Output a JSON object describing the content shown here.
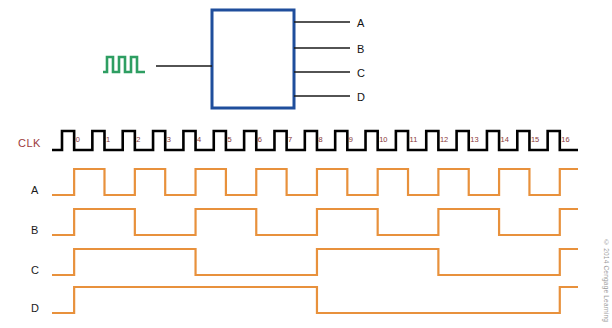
{
  "figure": {
    "type": "timing-diagram",
    "background_color": "#ffffff"
  },
  "block_diagram": {
    "box": {
      "border_color": "#1f4e9c",
      "fill_color": "#ffffff",
      "x": 212,
      "y": 10,
      "width": 82,
      "height": 98
    },
    "clk_input_label": "CLK",
    "clk_input_color": "#a04848",
    "clock_symbol": {
      "name": "clock-pulse-icon",
      "color": "#2e9e62",
      "pulses": 3
    },
    "outputs": [
      {
        "pin": "Q",
        "sub": "A",
        "net": "A"
      },
      {
        "pin": "Q",
        "sub": "B",
        "net": "B"
      },
      {
        "pin": "Q",
        "sub": "C",
        "net": "C"
      },
      {
        "pin": "Q",
        "sub": "D",
        "net": "D"
      }
    ],
    "wire_color": "#1a1a1a"
  },
  "timing": {
    "clk_row_label": "CLK",
    "clk_label_color": "#9c3b3b",
    "clk_trace_color": "#000000",
    "signal_trace_color": "#e8913c",
    "cycle_number_color": "#8a3a3a",
    "cycle_numbers": [
      "0",
      "1",
      "2",
      "3",
      "4",
      "5",
      "6",
      "7",
      "8",
      "9",
      "10",
      "11",
      "12",
      "13",
      "14",
      "15",
      "16"
    ],
    "rows": [
      {
        "label": "CLK",
        "divider": 1
      },
      {
        "label": "A",
        "divider": 2
      },
      {
        "label": "B",
        "divider": 4
      },
      {
        "label": "C",
        "divider": 8
      },
      {
        "label": "D",
        "divider": 16
      }
    ]
  },
  "chart_data": {
    "type": "line",
    "xlabel": "Clock pulse number",
    "ylabel": "Logic level",
    "x": [
      0,
      1,
      2,
      3,
      4,
      5,
      6,
      7,
      8,
      9,
      10,
      11,
      12,
      13,
      14,
      15,
      16
    ],
    "series": [
      {
        "name": "CLK",
        "divider": 1,
        "values": [
          0,
          0,
          0,
          0,
          0,
          0,
          0,
          0,
          0,
          0,
          0,
          0,
          0,
          0,
          0,
          0,
          0
        ]
      },
      {
        "name": "A",
        "divider": 2,
        "values": [
          0,
          1,
          0,
          1,
          0,
          1,
          0,
          1,
          0,
          1,
          0,
          1,
          0,
          1,
          0,
          1,
          0
        ]
      },
      {
        "name": "B",
        "divider": 4,
        "values": [
          0,
          0,
          1,
          1,
          0,
          0,
          1,
          1,
          0,
          0,
          1,
          1,
          0,
          0,
          1,
          1,
          0
        ]
      },
      {
        "name": "C",
        "divider": 8,
        "values": [
          0,
          0,
          0,
          0,
          1,
          1,
          1,
          1,
          0,
          0,
          0,
          0,
          1,
          1,
          1,
          1,
          0
        ]
      },
      {
        "name": "D",
        "divider": 16,
        "values": [
          0,
          0,
          0,
          0,
          0,
          0,
          0,
          0,
          1,
          1,
          1,
          1,
          1,
          1,
          1,
          1,
          0
        ]
      }
    ],
    "legend": "none",
    "grid": false
  },
  "credit": {
    "text": "© 2014 Cengage Learning",
    "color": "#9a9a9a"
  }
}
